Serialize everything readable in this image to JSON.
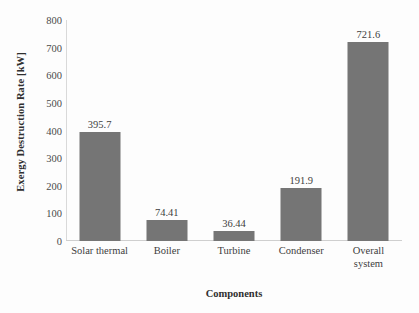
{
  "chart_data": {
    "type": "bar",
    "title": "",
    "categories": [
      "Solar thermal",
      "Boiler",
      "Turbine",
      "Condenser",
      "Overall system"
    ],
    "values": [
      395.7,
      74.41,
      36.44,
      191.9,
      721.6
    ],
    "data_labels": [
      "395.7",
      "74.41",
      "36.44",
      "191.9",
      "721.6"
    ],
    "xlabel": "Components",
    "ylabel": "Exergy Destruction Rate [kW]",
    "ylim": [
      0,
      800
    ],
    "ytick_labels": [
      "0",
      "100",
      "200",
      "300",
      "400",
      "500",
      "600",
      "700",
      "800"
    ],
    "ytick_values": [
      0,
      100,
      200,
      300,
      400,
      500,
      600,
      700,
      800
    ],
    "grid": false,
    "legend": false,
    "bar_color": "#757575",
    "axis_color": "#cfcfcf",
    "background_color": "#ffffff"
  }
}
